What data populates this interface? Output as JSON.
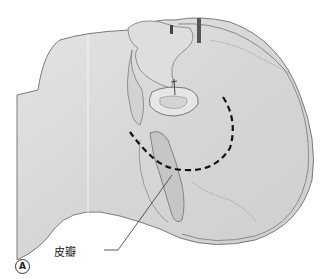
{
  "figure": {
    "panel_letter": "A",
    "labels": {
      "flap": "皮瓣"
    },
    "colors": {
      "skin_fill": "#d9d9d9",
      "skin_shade": "#bdbdbd",
      "outline": "#6e6e6e",
      "incision_dashes": "#111111",
      "background": "#ffffff"
    },
    "description_elements": [
      "head-outline",
      "ear",
      "flap",
      "dashed-incision-line",
      "sutures",
      "leader-line"
    ]
  }
}
